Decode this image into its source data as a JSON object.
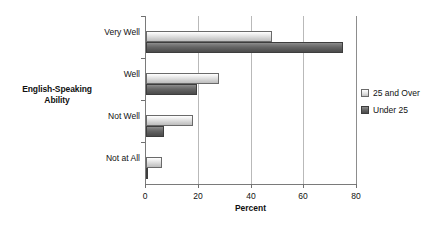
{
  "chart_data": {
    "type": "bar",
    "orientation": "horizontal",
    "title": "",
    "xlabel": "Percent",
    "ylabel": "English-Speaking Ability",
    "xlim": [
      0,
      80
    ],
    "xticks": [
      0,
      20,
      40,
      60,
      80
    ],
    "xtick_labels": [
      "0",
      "20",
      "40",
      "60",
      "80"
    ],
    "grid": true,
    "grid_axis": "x",
    "legend_position": "right",
    "categories": [
      "Very Well",
      "Well",
      "Not Well",
      "Not at All"
    ],
    "series": [
      {
        "name": "25 and Over",
        "color": "#dcdcdc",
        "values": [
          47.7,
          27.7,
          17.8,
          6.0
        ]
      },
      {
        "name": "Under 25",
        "color": "#5e5e5e",
        "values": [
          74.6,
          19.3,
          7.0,
          0.6
        ]
      }
    ]
  },
  "axes": {
    "y_title_line1": "English-Speaking",
    "y_title_line2": "Ability",
    "x_title": "Percent"
  },
  "legend": {
    "items": [
      {
        "label": "25 and Over",
        "swatch": "light-gradient-swatch"
      },
      {
        "label": "Under 25",
        "swatch": "dark-gradient-swatch"
      }
    ]
  }
}
